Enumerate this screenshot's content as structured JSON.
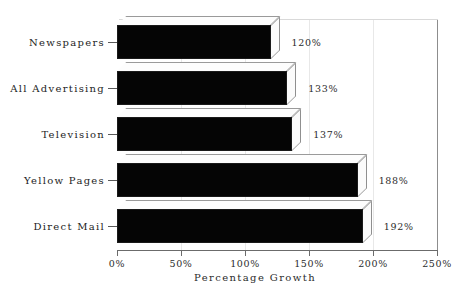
{
  "chart_data": {
    "type": "bar",
    "orientation": "horizontal",
    "title": "",
    "xlabel": "Percentage Growth",
    "ylabel": "",
    "categories": [
      "Newspapers",
      "All Advertising",
      "Television",
      "Yellow Pages",
      "Direct Mail"
    ],
    "values": [
      120,
      133,
      137,
      188,
      192
    ],
    "value_labels": [
      "120%",
      "133%",
      "137%",
      "188%",
      "192%"
    ],
    "xlim": [
      0,
      250
    ],
    "xticks": [
      0,
      50,
      100,
      150,
      200,
      250
    ],
    "xtick_labels": [
      "0%",
      "50%",
      "100%",
      "150%",
      "200%",
      "250%"
    ],
    "grid": false,
    "legend": null,
    "bar_color": "#050505",
    "style": "3d-extruded"
  },
  "axis": {
    "x_title": "Percentage Growth"
  }
}
